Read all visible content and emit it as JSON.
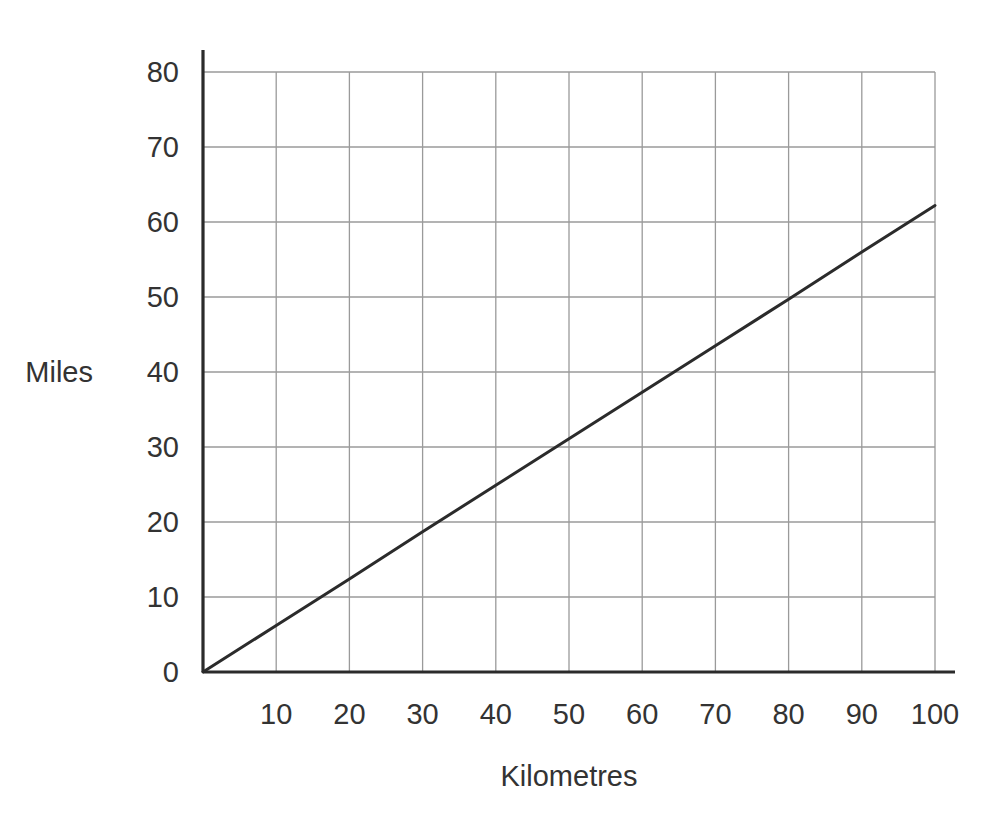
{
  "chart_data": {
    "type": "line",
    "title": "",
    "subtitle": "",
    "xlabel": "Kilometres",
    "ylabel": "Miles",
    "xlim": [
      0,
      100
    ],
    "ylim": [
      0,
      80
    ],
    "xticks": [
      10,
      20,
      30,
      40,
      50,
      60,
      70,
      80,
      90,
      100
    ],
    "xtick_labels": [
      "10",
      "20",
      "30",
      "40",
      "50",
      "60",
      "70",
      "80",
      "90",
      "100"
    ],
    "yticks": [
      0,
      10,
      20,
      30,
      40,
      50,
      60,
      70,
      80
    ],
    "ytick_labels": [
      "0",
      "10",
      "20",
      "30",
      "40",
      "50",
      "60",
      "70",
      "80"
    ],
    "grid": true,
    "grid_color": "#9a9a9a",
    "axis_color": "#2b2b2b",
    "legend": null,
    "legend_position": "none",
    "series": [
      {
        "name": "Kilometres to Miles conversion",
        "color": "#2b2b2b",
        "line_width": 3,
        "x": [
          0,
          10,
          20,
          30,
          40,
          50,
          60,
          70,
          80,
          90,
          100
        ],
        "values": [
          0,
          6.2,
          12.4,
          18.7,
          24.9,
          31.1,
          37.3,
          43.5,
          49.7,
          56.0,
          62.2
        ]
      }
    ],
    "annotations": []
  },
  "axes": {
    "y_title": "Miles",
    "x_title": "Kilometres"
  },
  "geometry": {
    "origin_x": 203,
    "origin_y": 672,
    "x_per_unit": 7.32,
    "y_per_unit": 7.5,
    "y_axis_top": 50,
    "x_axis_right": 955,
    "grid_right": 935,
    "grid_top": 72
  }
}
